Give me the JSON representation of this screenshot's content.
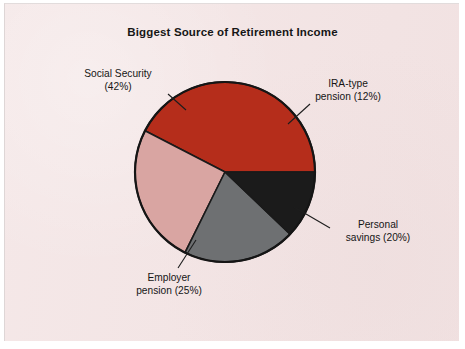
{
  "figure": {
    "title": "Biggest Source of Retirement Income",
    "background_color": "#f3e4e4",
    "page_color": "#ffffff"
  },
  "chart_data": {
    "type": "pie",
    "title": "Biggest Source of Retirement Income",
    "xlabel": "",
    "ylabel": "",
    "legend_position": "none",
    "labels_position": "outside-with-leader-lines",
    "grid": false,
    "units": "percent",
    "total": 99,
    "categories": [
      "Social Security",
      "IRA-type pension",
      "Personal savings",
      "Employer pension"
    ],
    "values": [
      42,
      12,
      20,
      25
    ],
    "colors": [
      "#b52d1b",
      "#1b1b1b",
      "#6e7072",
      "#d9a5a2"
    ],
    "slices": [
      {
        "name": "Social Security",
        "value": 42,
        "label": "Social Security",
        "value_label": "(42%)",
        "color": "#b52d1b",
        "start_angle_deg": 0,
        "end_angle_deg": 151.2
      },
      {
        "name": "IRA-type pension",
        "value": 12,
        "label": "IRA-type",
        "value_label": "pension (12%)",
        "color": "#1b1b1b",
        "start_angle_deg": 316.8,
        "end_angle_deg": 360
      },
      {
        "name": "Personal savings",
        "value": 20,
        "label": "Personal",
        "value_label": "savings (20%)",
        "color": "#6e7072",
        "start_angle_deg": 244.8,
        "end_angle_deg": 316.8
      },
      {
        "name": "Employer pension",
        "value": 25,
        "label": "Employer",
        "value_label": "pension (25%)",
        "color": "#d9a5a2",
        "start_angle_deg": 151.2,
        "end_angle_deg": 244.8
      }
    ]
  },
  "labels": {
    "social_security_line1": "Social Security",
    "social_security_line2": "(42%)",
    "ira_line1": "IRA-type",
    "ira_line2": "pension (12%)",
    "personal_line1": "Personal",
    "personal_line2": "savings (20%)",
    "employer_line1": "Employer",
    "employer_line2": "pension (25%)"
  }
}
